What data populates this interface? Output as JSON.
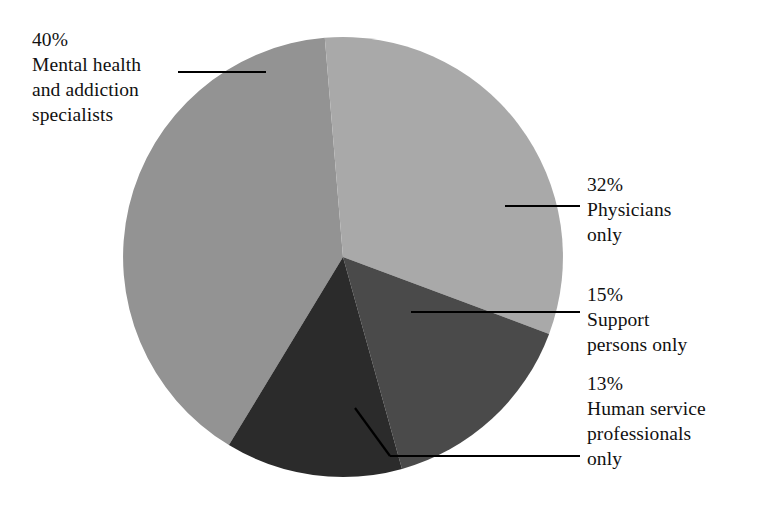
{
  "chart_data": {
    "type": "pie",
    "title": "",
    "categories": [
      "Mental health and addiction specialists",
      "Physicians only",
      "Support persons only",
      "Human service professionals only"
    ],
    "values": [
      40,
      32,
      15,
      13
    ],
    "value_labels": [
      "40%",
      "32%",
      "15%",
      "13%"
    ],
    "colors": [
      "#939393",
      "#a9a9a9",
      "#4a4a4a",
      "#2b2b2b"
    ],
    "legend": "none",
    "grid": false,
    "background": "#ffffff",
    "text_color": "#111111",
    "slices": [
      {
        "percent_label": "40%",
        "name_lines": [
          "Mental health",
          "and addiction",
          "specialists"
        ],
        "color": "#939393",
        "value": 40
      },
      {
        "percent_label": "32%",
        "name_lines": [
          "Physicians",
          "only"
        ],
        "color": "#a9a9a9",
        "value": 32
      },
      {
        "percent_label": "15%",
        "name_lines": [
          "Support",
          "persons only"
        ],
        "color": "#4a4a4a",
        "value": 15
      },
      {
        "percent_label": "13%",
        "name_lines": [
          "Human service",
          "professionals",
          "only"
        ],
        "color": "#2b2b2b",
        "value": 13
      }
    ]
  },
  "labels": {
    "mental": {
      "pct": "40%",
      "l1": "Mental health",
      "l2": "and addiction",
      "l3": "specialists"
    },
    "physicians": {
      "pct": "32%",
      "l1": "Physicians",
      "l2": "only"
    },
    "support": {
      "pct": "15%",
      "l1": "Support",
      "l2": "persons only"
    },
    "human": {
      "pct": "13%",
      "l1": "Human service",
      "l2": "professionals",
      "l3": "only"
    }
  }
}
